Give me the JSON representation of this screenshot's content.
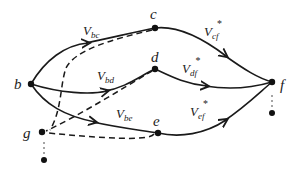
{
  "diagram": {
    "nodes": {
      "b": {
        "label": "b"
      },
      "c": {
        "label": "c"
      },
      "d": {
        "label": "d"
      },
      "e": {
        "label": "e"
      },
      "f": {
        "label": "f"
      },
      "g": {
        "label": "g"
      }
    },
    "edges": {
      "bc": {
        "main": "V",
        "sub": "bc",
        "sup": ""
      },
      "bd": {
        "main": "V",
        "sub": "bd",
        "sup": ""
      },
      "be": {
        "main": "V",
        "sub": "be",
        "sup": ""
      },
      "cf": {
        "main": "V",
        "sub": "cf",
        "sup": "*"
      },
      "df": {
        "main": "V",
        "sub": "df",
        "sup": "*"
      },
      "ef": {
        "main": "V",
        "sub": "ef",
        "sup": "*"
      }
    },
    "dashed_edges": [
      "c-g",
      "d-g",
      "e-g"
    ],
    "continuation": {
      "f_below": "⋮",
      "g_below": "⋮"
    }
  }
}
